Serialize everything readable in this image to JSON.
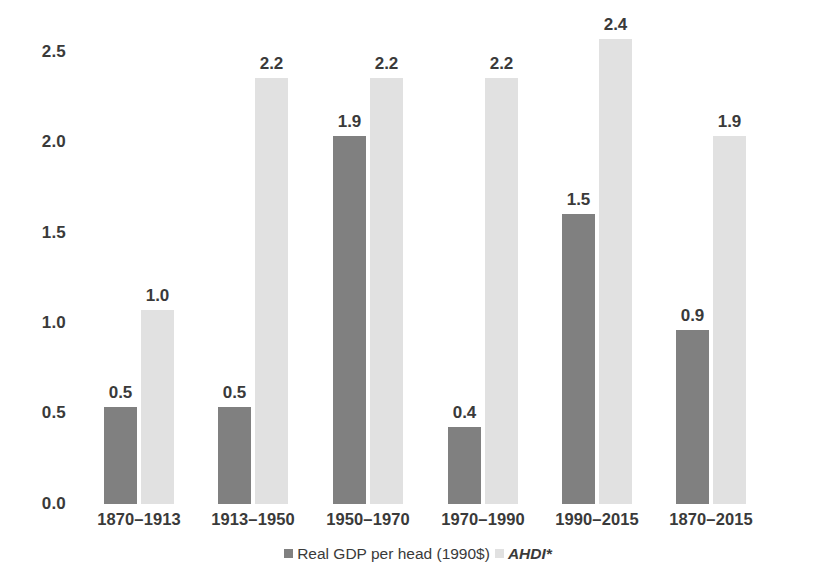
{
  "chart_data": {
    "type": "bar",
    "title": "",
    "subtitle": "",
    "xlabel": "",
    "ylabel": "",
    "ylim": [
      0.0,
      2.5
    ],
    "yticks": [
      "0.0",
      "0.5",
      "1.0",
      "1.5",
      "2.0",
      "2.5"
    ],
    "ytick_values": [
      0.0,
      0.5,
      1.0,
      1.5,
      2.0,
      2.5
    ],
    "grid": false,
    "legend_position": "bottom-center",
    "categories": [
      "1870–1913",
      "1913–1950",
      "1950–1970",
      "1970–1990",
      "1990–2015",
      "1870–2015"
    ],
    "series": [
      {
        "name": "Real GDP per head (1990$)",
        "color": "#808080",
        "values": [
          0.5,
          0.5,
          1.9,
          0.4,
          1.5,
          0.9
        ],
        "labels": [
          "0.5",
          "0.5",
          "1.9",
          "0.4",
          "1.5",
          "0.9"
        ]
      },
      {
        "name": "AHDI*",
        "color": "#e1e1e1",
        "italic": true,
        "values": [
          1.0,
          2.2,
          2.2,
          2.2,
          2.4,
          1.9
        ],
        "labels": [
          "1.0",
          "2.2",
          "2.2",
          "2.2",
          "2.4",
          "1.9"
        ]
      }
    ]
  },
  "axis": {
    "y_ticks": [
      {
        "label": "2.5",
        "value": 2.5
      },
      {
        "label": "2.0",
        "value": 2.0
      },
      {
        "label": "1.5",
        "value": 1.5
      },
      {
        "label": "1.0",
        "value": 1.0
      },
      {
        "label": "0.5",
        "value": 0.5
      },
      {
        "label": "0.0",
        "value": 0.0
      }
    ],
    "x_categories": [
      "1870–1913",
      "1913–1950",
      "1950–1970",
      "1970–1990",
      "1990–2015",
      "1870–2015"
    ]
  },
  "legend": {
    "items": [
      {
        "label": "Real GDP per head (1990$)",
        "color": "#808080",
        "italic": false
      },
      {
        "label": "AHDI*",
        "color": "#e1e1e1",
        "italic": true
      }
    ]
  }
}
